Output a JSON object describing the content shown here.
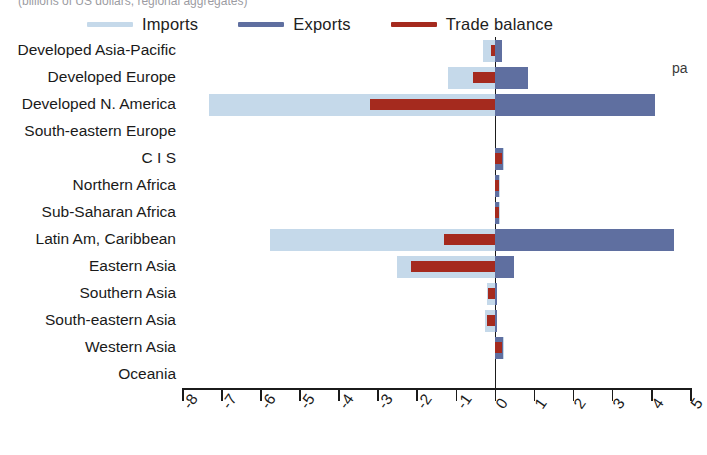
{
  "caption": {
    "top_left_clipped": "(billions of US dollars, regional aggregates)",
    "top_right_clipped": "",
    "side_note": "pa"
  },
  "legend": {
    "position": "top-center",
    "items": [
      {
        "label": "Imports",
        "color": "#c5d9ea",
        "name": "imports"
      },
      {
        "label": "Exports",
        "color": "#5f6fa0",
        "name": "exports"
      },
      {
        "label": "Trade balance",
        "color": "#a52a1e",
        "name": "trade-balance"
      }
    ]
  },
  "chart_data": {
    "type": "bar",
    "orientation": "horizontal",
    "title": "",
    "xlabel": "",
    "ylabel": "",
    "xlim": [
      -8,
      5
    ],
    "xticks": [
      -8,
      -7,
      -6,
      -5,
      -4,
      -3,
      -2,
      -1,
      0,
      1,
      2,
      3,
      4,
      5
    ],
    "xticklabels": [
      "-8",
      "-7",
      "-6",
      "-5",
      "-4",
      "-3",
      "-2",
      "-1",
      "0",
      "1",
      "2",
      "3",
      "4",
      "5"
    ],
    "grid": false,
    "zero_line": 0,
    "categories": [
      "Developed Asia-Pacific",
      "Developed Europe",
      "Developed N. America",
      "South-eastern Europe",
      "C I S",
      "Northern Africa",
      "Sub-Saharan Africa",
      "Latin Am, Caribbean",
      "Eastern Asia",
      "Southern Asia",
      "South-eastern Asia",
      "Western Asia",
      "Oceania"
    ],
    "series": [
      {
        "name": "Imports",
        "color": "#c5d9ea",
        "values": [
          -0.3,
          -1.2,
          -7.3,
          0.0,
          0.25,
          0.15,
          0.15,
          -5.75,
          -2.5,
          -0.2,
          -0.25,
          0.25,
          0.0
        ]
      },
      {
        "name": "Exports",
        "color": "#5f6fa0",
        "values": [
          0.2,
          0.85,
          4.1,
          0.0,
          0.22,
          0.12,
          0.12,
          4.6,
          0.5,
          0.05,
          0.05,
          0.22,
          0.0
        ]
      },
      {
        "name": "Trade balance",
        "color": "#a52a1e",
        "values": [
          -0.1,
          -0.55,
          -3.2,
          0.0,
          0.18,
          0.1,
          0.1,
          -1.3,
          -2.15,
          -0.18,
          -0.2,
          0.18,
          0.0
        ]
      }
    ]
  }
}
